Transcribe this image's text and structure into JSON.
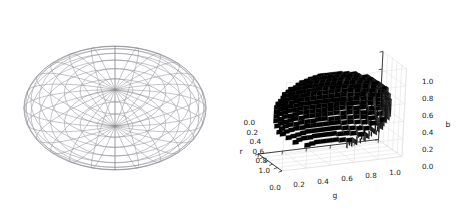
{
  "figure": {
    "background_color": "#ffffff",
    "width": 473,
    "height": 215,
    "panel_count": 2
  },
  "chart_data": [
    {
      "type": "surface",
      "name": "wireframe-ellipsoid",
      "render_style": "wireframe",
      "title": "",
      "xlabel": "",
      "ylabel": "",
      "zlabel": "",
      "axes_visible": false,
      "grid": false,
      "legend": null,
      "tick_labels": [],
      "line_color": "#888888",
      "geometry": {
        "shape": "ellipsoid",
        "center_px": [
          115,
          108
        ],
        "semi_axis_x_px": 91,
        "semi_axis_y_px": 62,
        "meridians": 24,
        "parallels": 16
      }
    },
    {
      "type": "voxel",
      "name": "rgb-voxel-ellipsoid",
      "render_style": "voxels",
      "title": "",
      "xlabel": "r",
      "ylabel": "g",
      "zlabel": "b",
      "grid": true,
      "grid_color": "#d9d9d9",
      "pane_color": "#ffffff",
      "voxel_color": "#0d0d0d",
      "voxel_shade_colors": [
        "#000000",
        "#141414",
        "#2e2e2e",
        "#4a4a4a",
        "#6b6b6b"
      ],
      "axes": {
        "r": {
          "label": "r",
          "ticks": [
            "0.0",
            "0.2",
            "0.4",
            "0.6",
            "0.8",
            "1.0"
          ],
          "values": [
            0.0,
            0.2,
            0.4,
            0.6,
            0.8,
            1.0
          ],
          "lim": [
            0.0,
            1.0
          ],
          "position": "left"
        },
        "g": {
          "label": "g",
          "ticks": [
            "0.0",
            "0.2",
            "0.4",
            "0.6",
            "0.8",
            "1.0"
          ],
          "values": [
            0.0,
            0.2,
            0.4,
            0.6,
            0.8,
            1.0
          ],
          "lim": [
            0.0,
            1.0
          ],
          "position": "bottom"
        },
        "b": {
          "label": "b",
          "ticks": [
            "0.0",
            "0.2",
            "0.4",
            "0.6",
            "0.8",
            "1.0"
          ],
          "values": [
            0.0,
            0.2,
            0.4,
            0.6,
            0.8,
            1.0
          ],
          "lim": [
            0.0,
            1.0
          ],
          "position": "right"
        }
      },
      "geometry": {
        "shape": "ellipsoid",
        "resolution": 32,
        "center_rgb": [
          0.5,
          0.5,
          0.5
        ]
      }
    }
  ],
  "panels": {
    "wireframe": {
      "name": "wireframe ellipsoid plot"
    },
    "voxels": {
      "name": "voxel ellipsoid plot",
      "r_label": "r",
      "g_label": "g",
      "b_label": "b",
      "r_ticks": [
        "0.0",
        "0.2",
        "0.4",
        "0.6",
        "0.8",
        "1.0"
      ],
      "g_ticks": [
        "0.0",
        "0.2",
        "0.4",
        "0.6",
        "0.8",
        "1.0"
      ],
      "b_ticks": [
        "1.0",
        "0.8",
        "0.6",
        "0.4",
        "0.2",
        "0.0"
      ]
    }
  }
}
